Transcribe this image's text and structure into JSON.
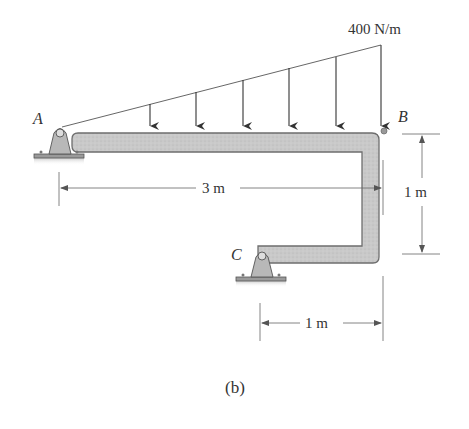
{
  "figure": {
    "caption": "(b)",
    "load": {
      "label": "400 N/m",
      "type": "triangular-distributed",
      "max_intensity": 400,
      "unit": "N/m",
      "arrow_count": 6
    },
    "points": {
      "A": "A",
      "B": "B",
      "C": "C"
    },
    "dimensions": {
      "ab_horizontal": "3 m",
      "b_vertical": "1 m",
      "c_horizontal": "1 m"
    },
    "colors": {
      "beam_fill": "#c8c8c8",
      "beam_stroke": "#6e6e6e",
      "line": "#555555",
      "text": "#333333"
    }
  }
}
